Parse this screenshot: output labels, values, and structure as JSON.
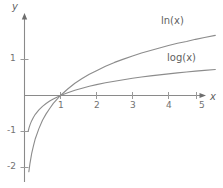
{
  "chart_data": {
    "type": "line",
    "title": "",
    "subtitle": "",
    "xlabel": "x",
    "ylabel": "y",
    "xlim": [
      -0.1,
      5.3
    ],
    "ylim": [
      -2.2,
      1.6
    ],
    "grid": false,
    "legend_position": "inline-right",
    "x_ticks": [
      "1",
      "2",
      "3",
      "4",
      "5"
    ],
    "x_tick_values": [
      1,
      2,
      3,
      4,
      5
    ],
    "y_ticks": [
      "1",
      "-1",
      "-2"
    ],
    "y_tick_values": [
      1,
      -1,
      -2
    ],
    "axis_origin_label": "",
    "series": [
      {
        "name": "ln(x)",
        "label": "ln(x)",
        "color": "#8c8c8c",
        "x": [
          0.12,
          0.15,
          0.2,
          0.25,
          0.3,
          0.4,
          0.5,
          0.6,
          0.7,
          0.8,
          0.9,
          1.0,
          1.2,
          1.4,
          1.6,
          1.8,
          2.0,
          2.25,
          2.5,
          2.75,
          3.0,
          3.25,
          3.5,
          3.75,
          4.0,
          4.25,
          4.5,
          4.75,
          5.0,
          5.3
        ],
        "y": [
          -2.12,
          -1.9,
          -1.61,
          -1.39,
          -1.2,
          -0.92,
          -0.69,
          -0.51,
          -0.36,
          -0.22,
          -0.11,
          0.0,
          0.18,
          0.34,
          0.47,
          0.59,
          0.69,
          0.81,
          0.92,
          1.01,
          1.1,
          1.18,
          1.25,
          1.32,
          1.39,
          1.45,
          1.5,
          1.56,
          1.61,
          1.67
        ]
      },
      {
        "name": "log(x)",
        "label": "log(x)",
        "color": "#8c8c8c",
        "x": [
          0.1,
          0.13,
          0.16,
          0.2,
          0.25,
          0.3,
          0.4,
          0.5,
          0.6,
          0.7,
          0.8,
          0.9,
          1.0,
          1.2,
          1.4,
          1.6,
          1.8,
          2.0,
          2.25,
          2.5,
          2.75,
          3.0,
          3.25,
          3.5,
          3.75,
          4.0,
          4.25,
          4.5,
          4.75,
          5.0,
          5.3
        ],
        "y": [
          -1.0,
          -0.886,
          -0.796,
          -0.699,
          -0.602,
          -0.523,
          -0.398,
          -0.301,
          -0.222,
          -0.155,
          -0.097,
          -0.046,
          0.0,
          0.079,
          0.146,
          0.204,
          0.255,
          0.301,
          0.352,
          0.398,
          0.439,
          0.477,
          0.512,
          0.544,
          0.574,
          0.602,
          0.628,
          0.653,
          0.677,
          0.699,
          0.724
        ]
      }
    ]
  },
  "annotations": {
    "ln_label": "ln(x)",
    "log_label": "log(x)",
    "y_axis_label": "y",
    "x_axis_label": "x"
  },
  "ticks": {
    "x": [
      {
        "label": "1"
      },
      {
        "label": "2"
      },
      {
        "label": "3"
      },
      {
        "label": "4"
      },
      {
        "label": "5"
      }
    ],
    "y": [
      {
        "label": "1"
      },
      {
        "label": "-1"
      },
      {
        "label": "-2"
      }
    ]
  },
  "style": {
    "axis_color": "#8a8a8a",
    "curve_color": "#8c8c8c",
    "text_color": "#6d6d6d",
    "background": "#ffffff"
  }
}
